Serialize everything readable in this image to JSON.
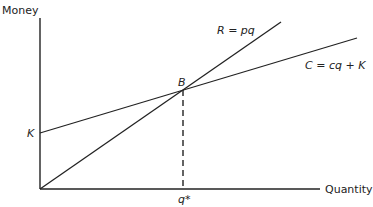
{
  "diagram": {
    "y_axis_label": "Money",
    "x_axis_label": "Quantity",
    "revenue_label": "R = pq",
    "cost_label": "C = cq + K",
    "intercept_label": "K",
    "break_even_label": "B",
    "break_even_quantity_label": "q*"
  },
  "geometry": {
    "origin": [
      40,
      189
    ],
    "y_axis_top": [
      40,
      18
    ],
    "x_axis_end": [
      320,
      189
    ],
    "revenue_line": [
      [
        40,
        189
      ],
      [
        281,
        22
      ]
    ],
    "cost_line": [
      [
        40,
        133
      ],
      [
        357,
        38
      ]
    ],
    "break_even_point": [
      183,
      90
    ]
  },
  "colors": {
    "line": "#222222"
  }
}
